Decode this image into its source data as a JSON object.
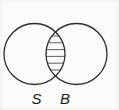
{
  "diagram": {
    "type": "venn",
    "sets": [
      {
        "label": "S"
      },
      {
        "label": "B"
      }
    ],
    "shaded_region": "intersection",
    "hatch": {
      "count": 6,
      "style": "horizontal-lines"
    },
    "colors": {
      "circle_stroke": "#2d2d2d",
      "hatch_stroke": "#4f4f4f",
      "label": "#1e1e1e",
      "background": "#fbfbfa"
    }
  }
}
